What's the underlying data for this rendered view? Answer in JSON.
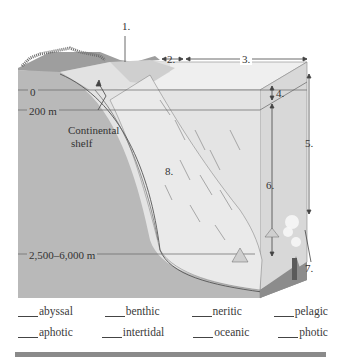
{
  "diagram": {
    "colors": {
      "land_face": "#b8b8b8",
      "water_top": "#eeeeee",
      "water_body": "#dedede",
      "deep_face": "#8e8e8e",
      "shelf": "#d4d4d4",
      "line": "#555555"
    },
    "number_labels": {
      "n1": "1.",
      "n2": "2.",
      "n3": "3.",
      "n4": "4.",
      "n5": "5.",
      "n6": "6.",
      "n7": "7.",
      "n8": "8."
    },
    "depth_labels": {
      "surface": "0",
      "shelf_depth": "200 m",
      "abyss_depth": "2,500–6,000 m"
    },
    "feature_labels": {
      "continental_shelf_line1": "Continental",
      "continental_shelf_line2": "shelf"
    }
  },
  "terms": {
    "row1": [
      "abyssal",
      "benthic",
      "neritic",
      "pelagic"
    ],
    "row2": [
      "aphotic",
      "intertidal",
      "oceanic",
      "photic"
    ]
  }
}
